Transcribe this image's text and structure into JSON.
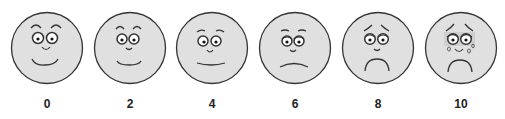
{
  "colors": {
    "face_fill": "#e0e0e0",
    "stroke": "#333333",
    "label": "#222222"
  },
  "faces": [
    {
      "label": "0",
      "expression": "very-happy",
      "cx": 47
    },
    {
      "label": "2",
      "expression": "happy",
      "cx": 130
    },
    {
      "label": "4",
      "expression": "slight-smile",
      "cx": 212
    },
    {
      "label": "6",
      "expression": "neutral-frown",
      "cx": 295
    },
    {
      "label": "8",
      "expression": "sad",
      "cx": 378
    },
    {
      "label": "10",
      "expression": "crying",
      "cx": 461
    }
  ]
}
